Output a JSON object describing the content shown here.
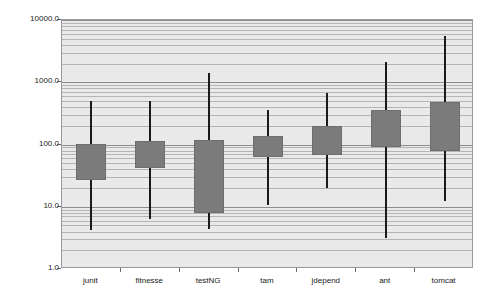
{
  "chart_data": {
    "type": "box",
    "title": "",
    "xlabel": "",
    "ylabel": "Lines per file",
    "yscale": "log",
    "ylim": [
      1.0,
      10000.0
    ],
    "grid": true,
    "legend": "none",
    "ytick_labels": [
      "10000.0",
      "1000.0",
      "100.0",
      "10.0",
      "1.0"
    ],
    "ytick_values": [
      10000.0,
      1000.0,
      100.0,
      10.0,
      1.0
    ],
    "categories": [
      "junit",
      "fitnesse",
      "testNG",
      "tam",
      "jdepend",
      "ant",
      "tomcat"
    ],
    "boxes": [
      {
        "category": "junit",
        "whisker_low": 4.2,
        "q1": 27,
        "q3": 102,
        "whisker_high": 500
      },
      {
        "category": "fitnesse",
        "whisker_low": 6.3,
        "q1": 42,
        "q3": 115,
        "whisker_high": 500
      },
      {
        "category": "testNG",
        "whisker_low": 4.4,
        "q1": 8.0,
        "q3": 120,
        "whisker_high": 1400
      },
      {
        "category": "tam",
        "whisker_low": 10.5,
        "q1": 62,
        "q3": 135,
        "whisker_high": 360
      },
      {
        "category": "jdepend",
        "whisker_low": 20,
        "q1": 69,
        "q3": 195,
        "whisker_high": 680
      },
      {
        "category": "ant",
        "whisker_low": 3.1,
        "q1": 92,
        "q3": 360,
        "whisker_high": 2100
      },
      {
        "category": "tomcat",
        "whisker_low": 12.5,
        "q1": 80,
        "q3": 480,
        "whisker_high": 5500
      }
    ]
  },
  "colors": {
    "box_fill": "#7b7b7b",
    "whisker": "#1a1a1a",
    "plot_background": "#e9e9e9",
    "gridline": "#b4b4b4",
    "plot_border": "#9a9a9a",
    "text": "#1a1a1a"
  }
}
